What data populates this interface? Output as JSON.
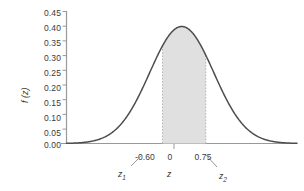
{
  "chart_data": {
    "type": "area",
    "title": "",
    "subtitle": "",
    "xlabel": "z",
    "ylabel": "f (z)",
    "curve": "standard normal probability density function",
    "xlim": [
      -3.6,
      3.6
    ],
    "ylim": [
      0.0,
      0.45
    ],
    "grid": false,
    "legend": null,
    "y_ticks": [
      "0.45",
      "0.40",
      "0.35",
      "0.30",
      "0.25",
      "0.20",
      "0.15",
      "0.10",
      "0.05",
      "0.00"
    ],
    "y_tick_values": [
      0.45,
      0.4,
      0.35,
      0.3,
      0.25,
      0.2,
      0.15,
      0.1,
      0.05,
      0.0
    ],
    "x_ticks": [
      "-0.60",
      "0",
      "0.75"
    ],
    "x_tick_values": [
      -0.6,
      0,
      0.75
    ],
    "peak_value": 0.3989,
    "peak_x": 0,
    "shaded_region": {
      "from": -0.6,
      "to": 0.75,
      "fill_color": "#e0e0e0",
      "border_style": "dashed"
    },
    "annotations": [
      {
        "name": "z1",
        "text": "z",
        "subscript": "1",
        "points_to": -0.6
      },
      {
        "name": "z-axis",
        "text": "z",
        "subscript": "",
        "points_to": 0
      },
      {
        "name": "z2",
        "text": "z",
        "subscript": "2",
        "points_to": 0.75
      }
    ],
    "series": [
      {
        "name": "normal-density",
        "x": [
          -3.6,
          -3.4,
          -3.2,
          -3.0,
          -2.8,
          -2.6,
          -2.4,
          -2.2,
          -2.0,
          -1.8,
          -1.6,
          -1.4,
          -1.2,
          -1.0,
          -0.8,
          -0.6,
          -0.4,
          -0.2,
          0.0,
          0.2,
          0.4,
          0.6,
          0.8,
          1.0,
          1.2,
          1.4,
          1.6,
          1.8,
          2.0,
          2.2,
          2.4,
          2.6,
          2.8,
          3.0,
          3.2,
          3.4,
          3.6
        ],
        "values": [
          0.0006,
          0.0012,
          0.0024,
          0.0044,
          0.0079,
          0.0136,
          0.0224,
          0.0355,
          0.054,
          0.079,
          0.1109,
          0.1497,
          0.1942,
          0.242,
          0.2897,
          0.3332,
          0.3683,
          0.391,
          0.3989,
          0.391,
          0.3683,
          0.3332,
          0.2897,
          0.242,
          0.1942,
          0.1497,
          0.1109,
          0.079,
          0.054,
          0.0355,
          0.0224,
          0.0136,
          0.0079,
          0.0044,
          0.0024,
          0.0012,
          0.0006
        ]
      }
    ]
  },
  "colors": {
    "curve": "#4d4d4d",
    "axis": "#999999",
    "shade_fill": "#e0e0e0",
    "shade_border": "#b3b3b3",
    "text": "#3a3a3a",
    "background": "#ffffff"
  }
}
